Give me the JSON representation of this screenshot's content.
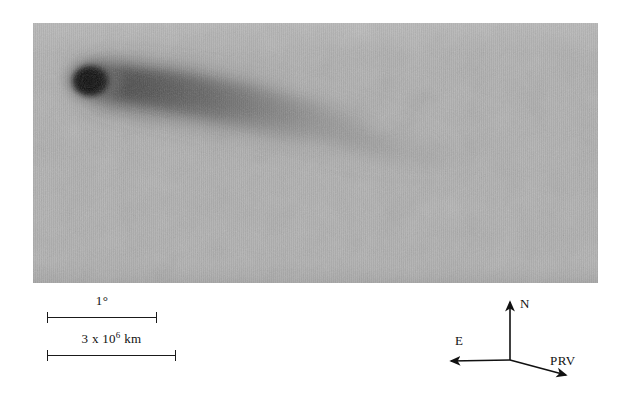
{
  "figure": {
    "kind": "astronomical-photographic-plate",
    "background_color": "#b2b2b2",
    "ink_color": "#111111",
    "page_color": "#ffffff"
  },
  "plate": {
    "name": "comet-plate",
    "x": 33,
    "y": 23,
    "width": 565,
    "height": 260,
    "comet": {
      "nucleus_center_x": 59,
      "nucleus_center_y": 57,
      "nucleus_radius_x": 17,
      "nucleus_radius_y": 14,
      "tail_direction": "right-and-slightly-down",
      "tail_tip_x": 430,
      "tail_tip_y": 130
    }
  },
  "scale_bars": [
    {
      "id": "angular",
      "name": "scale-bar-degree",
      "label_prefix": "1",
      "label_suffix": "°",
      "label_sup": "",
      "label_full": "1°",
      "length_px": 110
    },
    {
      "id": "linear",
      "name": "scale-bar-kilometres",
      "label_prefix": "3 x 10",
      "label_sup": "6",
      "label_suffix": " km",
      "label_full": "3 x 10⁶ km",
      "length_px": 129
    }
  ],
  "compass": {
    "name": "orientation-compass",
    "origin": {
      "x": 80,
      "y": 75
    },
    "arrows": [
      {
        "id": "north",
        "label": "N",
        "tip_x": 80,
        "tip_y": 14,
        "label_x": 90,
        "label_y": 20
      },
      {
        "id": "east",
        "label": "E",
        "tip_x": 17,
        "tip_y": 76,
        "label_x": 26,
        "label_y": 60
      },
      {
        "id": "prv",
        "label": "PRV",
        "tip_x": 140,
        "tip_y": 92,
        "label_x": 122,
        "label_y": 80
      }
    ]
  }
}
